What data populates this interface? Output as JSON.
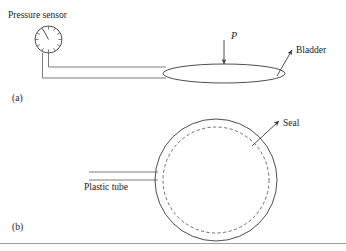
{
  "figure": {
    "panels": [
      {
        "tag": "(a)",
        "tag_x": 12,
        "tag_y": 101,
        "labels": [
          {
            "name": "pressure-sensor-label",
            "text": "Pressure sensor",
            "x": 8,
            "y": 18,
            "style": "plain"
          },
          {
            "name": "pressure-symbol-label",
            "text": "P",
            "x": 231,
            "y": 39,
            "style": "italic"
          },
          {
            "name": "bladder-label",
            "text": "Bladder",
            "x": 296,
            "y": 53,
            "style": "plain"
          }
        ],
        "gauge": {
          "name": "pressure-gauge",
          "cx": 48.5,
          "cy": 39.5,
          "r": 13.5,
          "tick_count": 12,
          "tick_inner_ratio": 0.74,
          "needle_angle_deg": -118,
          "needle_length_ratio": 0.82
        },
        "tube": {
          "name": "connecting-tube",
          "left_x_outer": 42.5,
          "left_x_inner": 48.5,
          "top_y": 53,
          "bend_y_inner": 67,
          "bend_y_outer": 78,
          "right_x": 166
        },
        "bladder": {
          "name": "bladder-shape",
          "cx": 224,
          "cy": 73.5,
          "rx": 61,
          "ry": 9.5
        },
        "pressure_arrow": {
          "name": "pressure-arrow",
          "x": 224,
          "y_start": 40,
          "y_end": 64
        },
        "bladder_leader": {
          "name": "bladder-leader-arrow",
          "x_start": 277,
          "y_start": 76,
          "x_end": 292,
          "y_end": 50
        }
      },
      {
        "tag": "(b)",
        "tag_x": 12,
        "tag_y": 230,
        "labels": [
          {
            "name": "plastic-tube-label",
            "text": "Plastic tube",
            "x": 84,
            "y": 190,
            "style": "plain"
          },
          {
            "name": "seal-label",
            "text": "Seal",
            "x": 283,
            "y": 126,
            "style": "plain"
          }
        ],
        "outer_circle": {
          "name": "bladder-outer-circle",
          "cx": 216,
          "cy": 180,
          "r": 61
        },
        "inner_circle": {
          "name": "seal-dashed-circle",
          "cx": 216,
          "cy": 180,
          "r": 53
        },
        "tube": {
          "name": "plastic-tube",
          "left_x": 89,
          "right_x": 158,
          "top_y": 172,
          "bottom_y": 180
        },
        "seal_leader": {
          "name": "seal-leader-arrow",
          "x_start": 252,
          "y_start": 146,
          "x_end": 279,
          "y_end": 121
        }
      }
    ],
    "bottom_rule": {
      "name": "bottom-divider",
      "x1": 0,
      "x2": 346,
      "y": 243.5
    },
    "colors": {
      "line": "#3a3a3a",
      "dashed": "#4a4a4a",
      "text": "#1a1a1a",
      "rule": "#888888",
      "background": "#ffffff"
    }
  }
}
